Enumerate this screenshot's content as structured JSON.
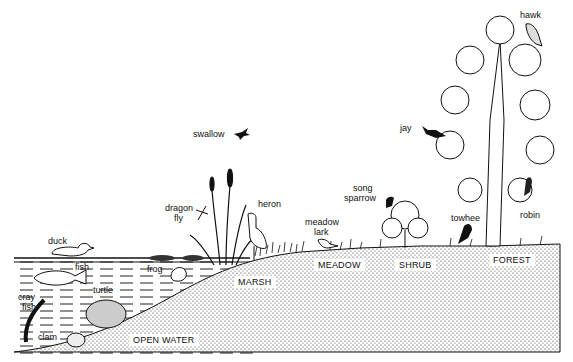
{
  "diagram": {
    "type": "ecological succession cross-section",
    "zones": [
      "OPEN WATER",
      "MARSH",
      "MEADOW",
      "SHRUB",
      "FOREST"
    ],
    "organisms": {
      "duck": "duck",
      "fish": "fish",
      "crayfish_1": "cray",
      "crayfish_2": "fish",
      "turtle": "turtle",
      "clam": "clam",
      "frog": "frog",
      "dragonfly_1": "dragon",
      "dragonfly_2": "fly",
      "heron": "heron",
      "swallow": "swallow",
      "meadowlark_1": "meadow",
      "meadowlark_2": "lark",
      "songsparrow_1": "song",
      "songsparrow_2": "sparrow",
      "jay": "jay",
      "towhee": "towhee",
      "robin": "robin",
      "hawk": "hawk"
    },
    "colors": {
      "ink": "#111111",
      "background": "#ffffff"
    }
  }
}
